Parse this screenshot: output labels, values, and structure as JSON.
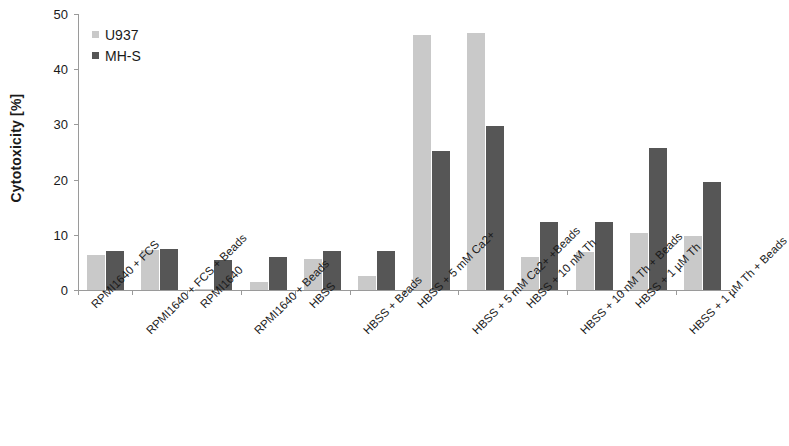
{
  "chart_data": {
    "type": "bar",
    "title": "",
    "xlabel": "",
    "ylabel": "Cytotoxicity [%]",
    "ylim": [
      0,
      50
    ],
    "yticks": [
      0,
      10,
      20,
      30,
      40,
      50
    ],
    "grid": false,
    "legend_position": "top-left",
    "categories": [
      "RPMI1640 + FCS",
      "RPMI1640 + FCS + Beads",
      "RPMI1640",
      "RPMI1640 + Beads",
      "HBSS",
      "HBSS + Beads",
      "HBSS + 5 mM Ca2+",
      "HBSS + 5 mM Ca2+ +Beads",
      "HBSS + 10 nM Th",
      "HBSS + 10 nM Th + Beads",
      "HBSS + 1 µM Th",
      "HBSS + 1 µM Th + Beads"
    ],
    "series": [
      {
        "name": "U937",
        "color": "#c9c9c9",
        "values": [
          6.4,
          7.2,
          0.2,
          1.4,
          5.7,
          2.6,
          46.2,
          46.6,
          6.0,
          6.8,
          10.4,
          9.7
        ]
      },
      {
        "name": "MH-S",
        "color": "#565656",
        "values": [
          7.0,
          7.5,
          5.4,
          5.9,
          7.0,
          7.0,
          25.2,
          29.8,
          12.4,
          12.4,
          25.7,
          19.6
        ]
      }
    ]
  },
  "axis": {
    "tick_labels": [
      "0",
      "10",
      "20",
      "30",
      "40",
      "50"
    ]
  }
}
